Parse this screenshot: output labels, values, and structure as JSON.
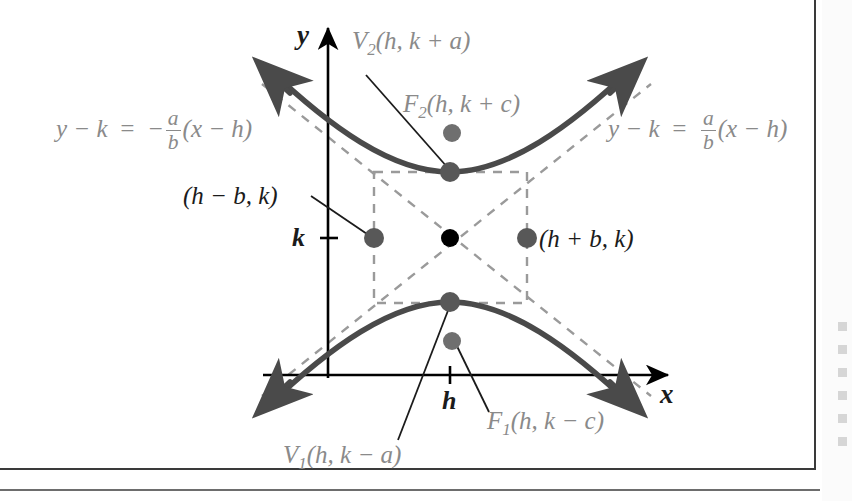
{
  "figure": {
    "type": "hyperbola-vertical-diagram",
    "axes": {
      "x_label": "x",
      "y_label": "y",
      "x_tick_label": "h",
      "y_tick_label": "k"
    },
    "asymptotes": {
      "left": {
        "lhs": "y − k",
        "equals": "=",
        "sign": "−",
        "numerator": "a",
        "denominator": "b",
        "rhs": "(x − h)",
        "color": "#8a8a8a"
      },
      "right": {
        "lhs": "y − k",
        "equals": "=",
        "sign": "",
        "numerator": "a",
        "denominator": "b",
        "rhs": "(x − h)",
        "color": "#8a8a8a"
      }
    },
    "points": [
      {
        "name": "upper-vertex",
        "label_main": "V",
        "label_sub": "2",
        "label_rest": "(h, k + a)",
        "color": "#8a8a8a",
        "dot_color": "#585858"
      },
      {
        "name": "upper-focus",
        "label_main": "F",
        "label_sub": "2",
        "label_rest": "(h, k + c)",
        "color": "#8a8a8a",
        "dot_color": "#6f6f6f"
      },
      {
        "name": "lower-vertex",
        "label_main": "V",
        "label_sub": "1",
        "label_rest": "(h, k − a)",
        "color": "#8a8a8a",
        "dot_color": "#585858"
      },
      {
        "name": "lower-focus",
        "label_main": "F",
        "label_sub": "1",
        "label_rest": "(h, k − c)",
        "color": "#8a8a8a",
        "dot_color": "#6f6f6f"
      },
      {
        "name": "left-box-point",
        "label_main": "",
        "label_sub": "",
        "label_rest": "(h − b, k)",
        "color": "#1b1b1b",
        "dot_color": "#585858"
      },
      {
        "name": "right-box-point",
        "label_main": "",
        "label_sub": "",
        "label_rest": "(h + b, k)",
        "color": "#1b1b1b",
        "dot_color": "#585858"
      },
      {
        "name": "center-point",
        "label_main": "",
        "label_sub": "",
        "label_rest": "",
        "color": "#000000",
        "dot_color": "#000000"
      }
    ],
    "colors": {
      "curve": "#4a4a4a",
      "axis": "#000000",
      "dashed": "#9a9a9a",
      "leader": "#1b1b1b",
      "background": "#ffffff",
      "frame_border": "#3a3a3a"
    }
  }
}
